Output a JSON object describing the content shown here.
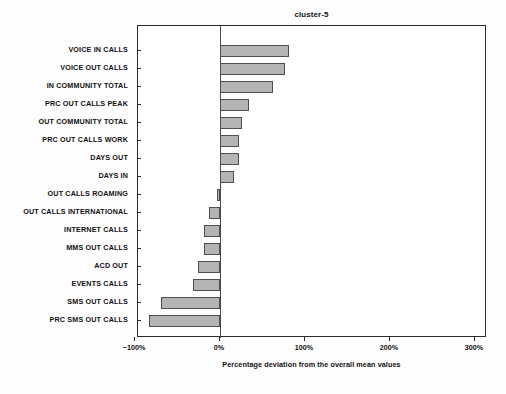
{
  "chart_data": {
    "type": "bar",
    "orientation": "horizontal",
    "title": "cluster-5",
    "xlabel": "Percentage deviation from the overall mean values",
    "ylabel": "",
    "xlim": [
      -100,
      310
    ],
    "xticks": [
      -100,
      0,
      100,
      200,
      300
    ],
    "xticklabels": [
      "−100%",
      "0%",
      "100%",
      "200%",
      "300%"
    ],
    "grid": false,
    "legend": null,
    "bar_color": "#b4b4b4",
    "bar_edge_color": "#4f4f4f",
    "categories": [
      "VOICE IN CALLS",
      "VOICE OUT CALLS",
      "IN COMMUNITY TOTAL",
      "PRC OUT CALLS PEAK",
      "OUT COMMUNITY TOTAL",
      "PRC OUT CALLS WORK",
      "DAYS OUT",
      "DAYS IN",
      "OUT CALLS ROAMING",
      "OUT CALLS INTERNATIONAL",
      "INTERNET CALLS",
      "MMS OUT CALLS",
      "ACD OUT",
      "EVENTS CALLS",
      "SMS OUT CALLS",
      "PRC SMS OUT CALLS"
    ],
    "values": [
      81,
      76,
      62,
      34,
      26,
      22,
      22,
      16,
      -3,
      -13,
      -19,
      -19,
      -26,
      -32,
      -69,
      -84
    ]
  }
}
